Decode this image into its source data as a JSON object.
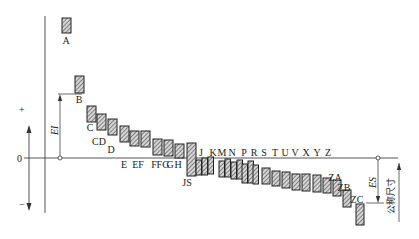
{
  "diagram": {
    "zero_line_label": "0",
    "plus_sign": "+",
    "minus_sign": "−",
    "EI_label": "EI",
    "ES_label": "ES",
    "nominal_size_label": "公称尺寸",
    "colors": {
      "line": "#333333",
      "bar_fill": "#cfcfcf",
      "hatch": "#444444",
      "background": "#ffffff"
    },
    "zero_line_y": 158,
    "bars": [
      {
        "label": "A",
        "x": 62,
        "top": 18,
        "bottom": 33,
        "label_x": 66,
        "label_y": 44
      },
      {
        "label": "B",
        "x": 75,
        "top": 76,
        "bottom": 93,
        "label_x": 79,
        "label_y": 103
      },
      {
        "label": "C",
        "x": 87,
        "top": 106,
        "bottom": 122,
        "label_x": 90,
        "label_y": 131
      },
      {
        "label": "CD",
        "x": 97,
        "top": 114,
        "bottom": 130,
        "label_x": 99,
        "label_y": 145
      },
      {
        "label": "D",
        "x": 108,
        "top": 119,
        "bottom": 135,
        "label_x": 111,
        "label_y": 153
      },
      {
        "label": "E",
        "x": 120,
        "top": 126,
        "bottom": 142,
        "label_x": 124,
        "label_y": 168
      },
      {
        "label": "EF",
        "x": 130,
        "top": 131,
        "bottom": 146,
        "label_x": 138,
        "label_y": 168
      },
      {
        "label": "F",
        "x": 141,
        "top": 131,
        "bottom": 147,
        "label_x": 154,
        "label_y": 168
      },
      {
        "label": "FG",
        "x": 153,
        "top": 139,
        "bottom": 155,
        "label_x": 163,
        "label_y": 168
      },
      {
        "label": "G",
        "x": 164,
        "top": 140,
        "bottom": 156,
        "label_x": 170,
        "label_y": 168
      },
      {
        "label": "H",
        "x": 175,
        "top": 144,
        "bottom": 158,
        "label_x": 178,
        "label_y": 168
      },
      {
        "label": "JS",
        "x": 187,
        "top": 143,
        "bottom": 176,
        "label_x": 187,
        "label_y": 186
      }
    ],
    "upper_labels": [
      {
        "label": "J",
        "x": 201,
        "y": 156
      },
      {
        "label": "K",
        "x": 213,
        "y": 156
      },
      {
        "label": "M",
        "x": 222,
        "y": 156
      },
      {
        "label": "N",
        "x": 232,
        "y": 156
      },
      {
        "label": "P",
        "x": 244,
        "y": 156
      },
      {
        "label": "R",
        "x": 254,
        "y": 156
      },
      {
        "label": "S",
        "x": 264,
        "y": 156
      },
      {
        "label": "T",
        "x": 275,
        "y": 156
      },
      {
        "label": "U",
        "x": 285,
        "y": 156
      },
      {
        "label": "V",
        "x": 295,
        "y": 156
      },
      {
        "label": "X",
        "x": 306,
        "y": 156
      },
      {
        "label": "Y",
        "x": 317,
        "y": 156
      },
      {
        "label": "Z",
        "x": 328,
        "y": 156
      },
      {
        "label": "ZA",
        "x": 335,
        "y": 181
      },
      {
        "label": "ZB",
        "x": 344,
        "y": 191
      },
      {
        "label": "ZC",
        "x": 357,
        "y": 203
      }
    ],
    "lower_bars": [
      {
        "x": 196,
        "top": 160,
        "bottom": 175
      },
      {
        "x": 202,
        "top": 158,
        "bottom": 175
      },
      {
        "x": 208,
        "top": 157,
        "bottom": 174
      },
      {
        "x": 219,
        "top": 161,
        "bottom": 177
      },
      {
        "x": 225,
        "top": 159,
        "bottom": 177
      },
      {
        "x": 231,
        "top": 162,
        "bottom": 179
      },
      {
        "x": 237,
        "top": 160,
        "bottom": 179
      },
      {
        "x": 242,
        "top": 164,
        "bottom": 183
      },
      {
        "x": 248,
        "top": 161,
        "bottom": 183
      },
      {
        "x": 253,
        "top": 165,
        "bottom": 184
      },
      {
        "x": 262,
        "top": 168,
        "bottom": 184
      },
      {
        "x": 272,
        "top": 171,
        "bottom": 186
      },
      {
        "x": 282,
        "top": 172,
        "bottom": 188
      },
      {
        "x": 292,
        "top": 174,
        "bottom": 190
      },
      {
        "x": 302,
        "top": 174,
        "bottom": 191
      },
      {
        "x": 313,
        "top": 175,
        "bottom": 192
      },
      {
        "x": 323,
        "top": 178,
        "bottom": 193
      },
      {
        "x": 333,
        "top": 180,
        "bottom": 196
      },
      {
        "x": 343,
        "top": 190,
        "bottom": 207
      },
      {
        "x": 356,
        "top": 204,
        "bottom": 225
      }
    ]
  }
}
